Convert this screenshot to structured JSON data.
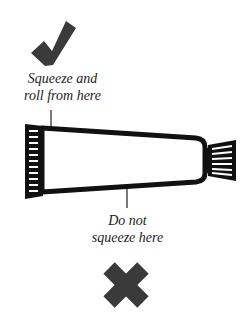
{
  "diagram": {
    "type": "instructional-illustration",
    "good_label": {
      "line1": "Squeeze and",
      "line2": "roll from here",
      "icon": "check-mark-icon"
    },
    "bad_label": {
      "line1": "Do not",
      "line2": "squeeze here",
      "icon": "cross-mark-icon"
    },
    "colors": {
      "icon": "#3a3a3a",
      "outline": "#111111",
      "text": "#222222",
      "background": "#ffffff"
    }
  }
}
